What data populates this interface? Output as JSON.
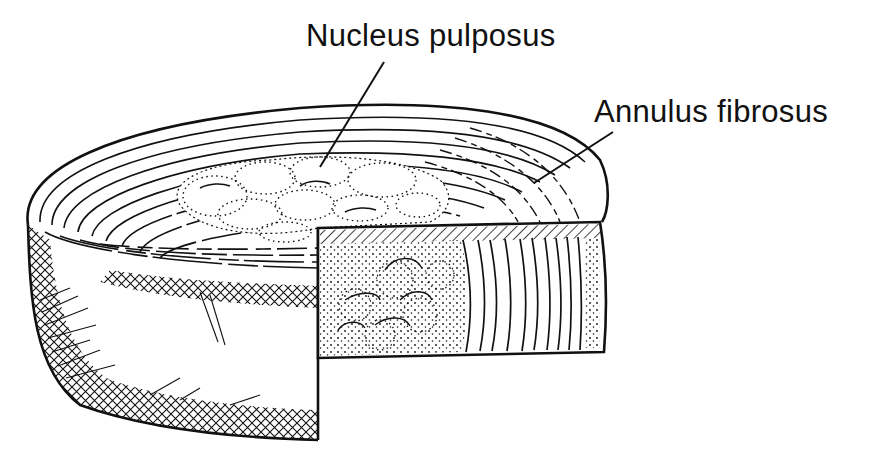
{
  "figure": {
    "labels": [
      {
        "id": "nucleus",
        "text": "Nucleus pulposus"
      },
      {
        "id": "annulus",
        "text": "Annulus fibrosus"
      }
    ],
    "colors": {
      "ink": "#111111",
      "background": "#ffffff"
    }
  }
}
